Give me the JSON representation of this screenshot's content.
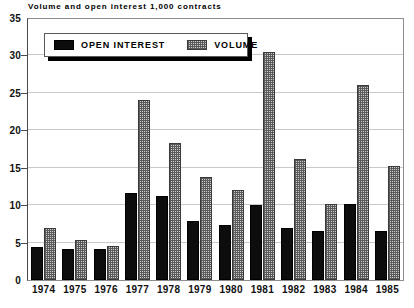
{
  "chart_data": {
    "type": "bar",
    "title": "Volume and open interest 1,000 contracts",
    "xlabel": "",
    "ylabel": "",
    "ylim": [
      0,
      35
    ],
    "yticks": [
      0,
      5,
      10,
      15,
      20,
      25,
      30,
      35
    ],
    "grid": true,
    "legend_position": "top-left",
    "categories": [
      "1974",
      "1975",
      "1976",
      "1977",
      "1978",
      "1979",
      "1980",
      "1981",
      "1982",
      "1983",
      "1984",
      "1985"
    ],
    "series": [
      {
        "name": "OPEN INTEREST",
        "color": "#0d0d0d",
        "fill": "solid-black",
        "values": [
          4.4,
          4.1,
          4.2,
          11.6,
          11.2,
          7.9,
          7.3,
          10.0,
          6.9,
          6.6,
          10.2,
          6.5
        ]
      },
      {
        "name": "VOLUME",
        "color": "#cfcfcf",
        "fill": "cross-hatch-gray",
        "values": [
          7.0,
          5.3,
          4.6,
          24.1,
          18.3,
          13.7,
          12.0,
          30.5,
          16.1,
          10.1,
          26.1,
          15.2
        ]
      }
    ]
  },
  "legend": {
    "entries": [
      {
        "label": "OPEN INTEREST"
      },
      {
        "label": "VOLUME"
      }
    ]
  }
}
